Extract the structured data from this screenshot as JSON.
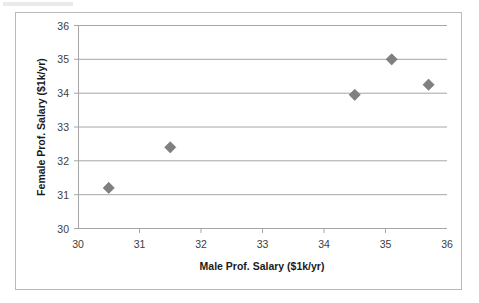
{
  "chart_data": {
    "type": "scatter",
    "title": "",
    "xlabel": "Male Prof. Salary ($1k/yr)",
    "ylabel": "Female Prof. Salary ($1k/yr)",
    "xlim": [
      30,
      36
    ],
    "ylim": [
      30,
      36
    ],
    "xticks": [
      "30",
      "31",
      "32",
      "33",
      "34",
      "35",
      "36"
    ],
    "yticks": [
      "30",
      "31",
      "32",
      "33",
      "34",
      "35",
      "36"
    ],
    "xtick_values": [
      30,
      31,
      32,
      33,
      34,
      35,
      36
    ],
    "ytick_values": [
      30,
      31,
      32,
      33,
      34,
      35,
      36
    ],
    "grid": "horizontal",
    "legend": "none",
    "marker": "diamond",
    "marker_color": "#808080",
    "points": [
      {
        "x": 30.5,
        "y": 31.2
      },
      {
        "x": 31.5,
        "y": 32.4
      },
      {
        "x": 34.5,
        "y": 33.95
      },
      {
        "x": 35.1,
        "y": 35.0
      },
      {
        "x": 35.7,
        "y": 34.25
      }
    ],
    "series": [
      {
        "name": "Professor Salaries",
        "x": [
          30.5,
          31.5,
          34.5,
          35.1,
          35.7
        ],
        "values": [
          31.2,
          32.4,
          33.95,
          35.0,
          34.25
        ]
      }
    ]
  },
  "axis_titles": {
    "x": "Male Prof. Salary ($1k/yr)",
    "y": "Female Prof. Salary ($1k/yr)"
  }
}
